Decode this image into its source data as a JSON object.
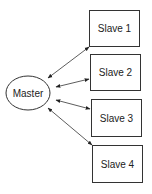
{
  "diagram": {
    "type": "master-slave topology",
    "master": {
      "label": "Master"
    },
    "slaves": [
      {
        "label": "Slave 1"
      },
      {
        "label": "Slave 2"
      },
      {
        "label": "Slave 3"
      },
      {
        "label": "Slave 4"
      }
    ],
    "edges": [
      {
        "from": "Master",
        "to": "Slave 1",
        "direction": "bidirectional"
      },
      {
        "from": "Master",
        "to": "Slave 2",
        "direction": "bidirectional"
      },
      {
        "from": "Master",
        "to": "Slave 3",
        "direction": "bidirectional"
      },
      {
        "from": "Master",
        "to": "Slave 4",
        "direction": "bidirectional"
      }
    ],
    "colors": {
      "stroke": "#333333",
      "fill": "#ffffff",
      "text": "#222222"
    }
  }
}
